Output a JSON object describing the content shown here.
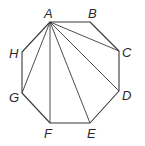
{
  "diagram": {
    "type": "octagon-diagonals",
    "stroke_color": "#3a3a3a",
    "vertices": [
      {
        "name": "A",
        "x": 50,
        "y": 22,
        "lx": 44,
        "ly": 18
      },
      {
        "name": "B",
        "x": 90,
        "y": 22,
        "lx": 88,
        "ly": 18
      },
      {
        "name": "C",
        "x": 119,
        "y": 51,
        "lx": 122,
        "ly": 57
      },
      {
        "name": "D",
        "x": 119,
        "y": 91,
        "lx": 122,
        "ly": 100
      },
      {
        "name": "E",
        "x": 90,
        "y": 123,
        "lx": 87,
        "ly": 138
      },
      {
        "name": "F",
        "x": 50,
        "y": 123,
        "lx": 44,
        "ly": 138
      },
      {
        "name": "G",
        "x": 22,
        "y": 93,
        "lx": 9,
        "ly": 102
      },
      {
        "name": "H",
        "x": 22,
        "y": 52,
        "lx": 9,
        "ly": 58
      }
    ],
    "diagonals_from": "A",
    "diagonals_to": [
      "C",
      "D",
      "E",
      "F",
      "G"
    ]
  }
}
